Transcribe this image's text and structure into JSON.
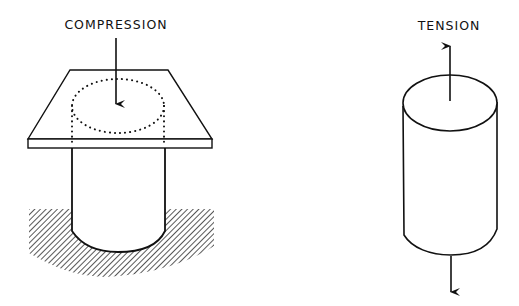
{
  "diagram": {
    "left_panel": {
      "label": "COMPRESSION",
      "description": "cylinder embedded in hatched ground, loaded by a flat plate with downward arrow"
    },
    "right_panel": {
      "label": "TENSION",
      "description": "free cylinder with arrows pulling up from top face and down from bottom"
    },
    "colors": {
      "stroke": "#111111",
      "background": "#ffffff"
    }
  }
}
